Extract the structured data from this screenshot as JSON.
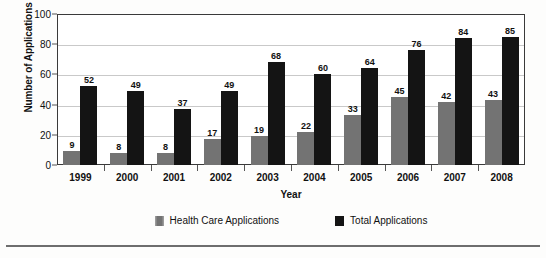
{
  "chart_data": {
    "type": "bar",
    "title": "",
    "xlabel": "Year",
    "ylabel": "Number of Applications",
    "categories": [
      "1999",
      "2000",
      "2001",
      "2002",
      "2003",
      "2004",
      "2005",
      "2006",
      "2007",
      "2008"
    ],
    "series": [
      {
        "name": "Health Care Applications",
        "color": "#737373",
        "values": [
          9,
          8,
          8,
          17,
          19,
          22,
          33,
          45,
          42,
          43
        ]
      },
      {
        "name": "Total Applications",
        "color": "#141414",
        "values": [
          52,
          49,
          37,
          49,
          68,
          60,
          64,
          76,
          84,
          85
        ]
      }
    ],
    "ylim": [
      0,
      100
    ],
    "yticks": [
      0,
      20,
      40,
      60,
      80,
      100
    ],
    "grid": true,
    "data_labels": true,
    "legend_position": "bottom"
  },
  "legend": {
    "items": [
      {
        "label": "Health Care Applications",
        "swatch": "health"
      },
      {
        "label": "Total Applications",
        "swatch": "total"
      }
    ]
  }
}
